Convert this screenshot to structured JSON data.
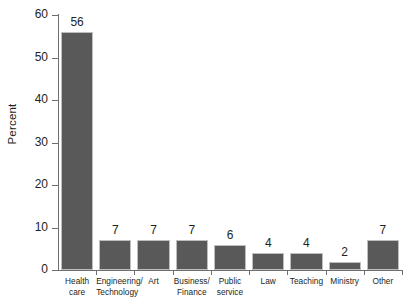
{
  "chart_data": {
    "type": "bar",
    "title": "",
    "subtitle": "",
    "xlabel": "",
    "ylabel": "Percent",
    "ylim": [
      0,
      60
    ],
    "yticks": [
      0,
      10,
      20,
      30,
      40,
      50,
      60
    ],
    "grid": false,
    "legend": null,
    "categories": [
      "Health\ncare",
      "Engineering/\nTechnology",
      "Art",
      "Business/\nFinance",
      "Public\nservice",
      "Law",
      "Teaching",
      "Ministry",
      "Other"
    ],
    "values": [
      56,
      7,
      7,
      7,
      6,
      4,
      4,
      2,
      7
    ],
    "data_labels": [
      "56",
      "7",
      "7",
      "7",
      "6",
      "4",
      "4",
      "2",
      "7"
    ],
    "colors": {
      "bar_fill": "#595959",
      "bar_border": "#bcbec0",
      "axis": "#6d6e71",
      "text": "#231f20",
      "background": "#ffffff"
    }
  }
}
